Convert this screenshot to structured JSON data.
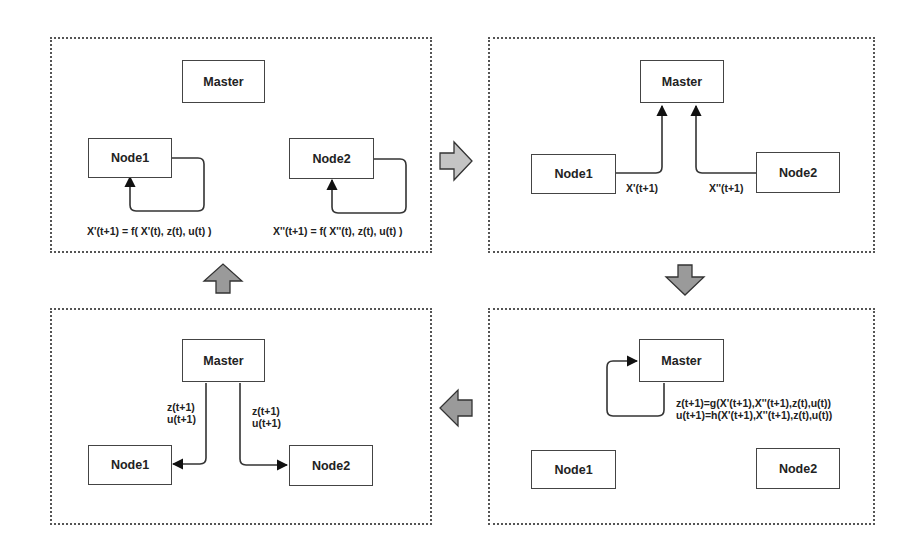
{
  "diagram": {
    "type": "iterative master-node update cycle",
    "colors": {
      "panel_border": "#555555",
      "box_border": "#444444",
      "flow_arrow_fill": "#9a9a9a",
      "flow_arrow_fill_light": "#c4c4c4",
      "line": "#333333"
    },
    "panels": [
      {
        "id": "local-update",
        "master": "Master",
        "node1": "Node1",
        "node2": "Node2",
        "node1_formula": "X'(t+1) = f(  X'(t), z(t), u(t) )",
        "node2_formula": "X''(t+1) = f(  X''(t), z(t), u(t) )"
      },
      {
        "id": "gather",
        "master": "Master",
        "node1": "Node1",
        "node2": "Node2",
        "node1_edge_label": "X'(t+1)",
        "node2_edge_label": "X''(t+1)"
      },
      {
        "id": "master-update",
        "master": "Master",
        "node1": "Node1",
        "node2": "Node2",
        "z_formula": "z(t+1)=g(X'(t+1),X''(t+1),z(t),u(t))",
        "u_formula": "u(t+1)=h(X'(t+1),X''(t+1),z(t),u(t))"
      },
      {
        "id": "broadcast",
        "master": "Master",
        "node1": "Node1",
        "node2": "Node2",
        "left_edge_label_line1": "z(t+1)",
        "left_edge_label_line2": "u(t+1)",
        "right_edge_label_line1": "z(t+1)",
        "right_edge_label_line2": "u(t+1)"
      }
    ],
    "flow_arrows": [
      {
        "from": "local-update",
        "to": "gather",
        "direction": "right"
      },
      {
        "from": "gather",
        "to": "master-update",
        "direction": "down"
      },
      {
        "from": "master-update",
        "to": "broadcast",
        "direction": "left"
      },
      {
        "from": "broadcast",
        "to": "local-update",
        "direction": "up"
      }
    ]
  }
}
